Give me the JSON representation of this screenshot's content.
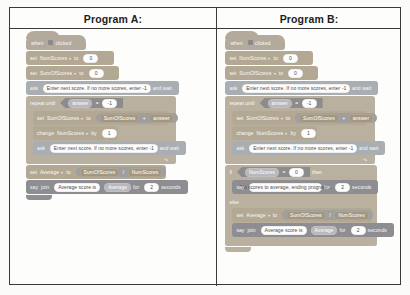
{
  "table": {
    "headers": [
      "Program A:",
      "Program B:"
    ]
  },
  "colors": {
    "event_block": "#b4aa9c",
    "variable_block": "#b3a893",
    "sensing_block": "#a9aeb3",
    "control_block": "#b9b0a0",
    "looks_block": "#8e8e92",
    "border": "#3a3a3a",
    "page_background": "#fbfbfa"
  },
  "program_a": {
    "title": "Program A:",
    "blocks": {
      "hat": {
        "when": "when",
        "icon": "green-flag-icon",
        "clicked": "clicked"
      },
      "set_numscores": {
        "set": "set",
        "variable": "NumScores",
        "to": "to",
        "value": "0"
      },
      "set_sumofscores": {
        "set": "set",
        "variable": "SumOfScores",
        "to": "to",
        "value": "0"
      },
      "ask1": {
        "ask": "ask",
        "prompt": "Enter next score. If no more scores, enter -1",
        "and_wait": "and wait"
      },
      "repeat_until": {
        "repeat_until": "repeat until",
        "left": "answer",
        "operator": "=",
        "right": "-1"
      },
      "set_sum_inner": {
        "set": "set",
        "variable": "SumOfScores",
        "to": "to",
        "left": "SumOfScores",
        "operator": "+",
        "right": "answer"
      },
      "change_numscores": {
        "change": "change",
        "variable": "NumScores",
        "by": "by",
        "value": "1"
      },
      "ask2": {
        "ask": "ask",
        "prompt": "Enter next score. If no more scores, enter -1",
        "and_wait": "and wait"
      },
      "set_average": {
        "set": "set",
        "variable": "Average",
        "to": "to",
        "left": "SumOfScores",
        "operator": "/",
        "right": "NumScores"
      },
      "say": {
        "say": "say",
        "join": "join",
        "text": "Average score is",
        "variable": "Average",
        "for": "for",
        "seconds_value": "2",
        "seconds": "seconds"
      }
    }
  },
  "program_b": {
    "title": "Program B:",
    "blocks": {
      "hat": {
        "when": "when",
        "icon": "green-flag-icon",
        "clicked": "clicked"
      },
      "set_numscores": {
        "set": "set",
        "variable": "NumScores",
        "to": "to",
        "value": "0"
      },
      "set_sumofscores": {
        "set": "set",
        "variable": "SumOfScores",
        "to": "to",
        "value": "0"
      },
      "ask1": {
        "ask": "ask",
        "prompt": "Enter next score. If no more scores, enter -1",
        "and_wait": "and wait"
      },
      "repeat_until": {
        "repeat_until": "repeat until",
        "left": "answer",
        "operator": "=",
        "right": "-1"
      },
      "set_sum_inner": {
        "set": "set",
        "variable": "SumOfScores",
        "to": "to",
        "left": "SumOfScores",
        "operator": "+",
        "right": "answer"
      },
      "change_numscores": {
        "change": "change",
        "variable": "NumScores",
        "by": "by",
        "value": "1"
      },
      "ask2": {
        "ask": "ask",
        "prompt": "Enter next score. If no more scores, enter -1",
        "and_wait": "and wait"
      },
      "if_block": {
        "if": "if",
        "left": "NumScores",
        "operator": "=",
        "right": "0",
        "then": "then"
      },
      "say_no_scores": {
        "say": "say",
        "text": "No scores to average, ending program...",
        "for": "for",
        "seconds_value": "2",
        "seconds": "seconds"
      },
      "else": {
        "else": "else"
      },
      "set_average": {
        "set": "set",
        "variable": "Average",
        "to": "to",
        "left": "SumOfScores",
        "operator": "/",
        "right": "NumScores"
      },
      "say": {
        "say": "say",
        "join": "join",
        "text": "Average score is",
        "variable": "Average",
        "for": "for",
        "seconds_value": "2",
        "seconds": "seconds"
      }
    }
  }
}
